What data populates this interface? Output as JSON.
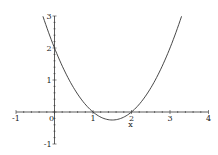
{
  "chart_data": {
    "type": "line",
    "title": "",
    "xlabel": "x",
    "ylabel": "",
    "function": "y = x^2 - 3x + 2",
    "xlim": [
      -1,
      4
    ],
    "ylim": [
      -1,
      3
    ],
    "grid": false,
    "legend": null,
    "x_ticks": [
      "-1",
      "0",
      "1",
      "2",
      "3",
      "4"
    ],
    "y_ticks": [
      "3",
      "2",
      "1",
      "-1"
    ],
    "series": [
      {
        "name": "f(x)",
        "x": [
          -0.3,
          0,
          0.5,
          1,
          1.5,
          2,
          2.5,
          3,
          3.3
        ],
        "y": [
          3.0,
          2.0,
          0.75,
          0,
          -0.25,
          0,
          0.75,
          2.0,
          3.0
        ]
      }
    ],
    "annotations": [
      {
        "text": "x",
        "x": 2,
        "y": 0,
        "position": "below tick 2"
      }
    ],
    "colors": {
      "axis": "#333333",
      "curve": "#333333"
    }
  }
}
